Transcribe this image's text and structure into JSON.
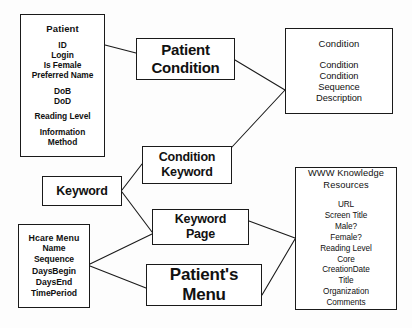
{
  "diagram": {
    "type": "entity-relationship",
    "background_color": "#fdfdfd",
    "line_color": "#1a1a1a",
    "text_color": "#111111",
    "nodes": [
      {
        "id": "patient",
        "kind": "entity",
        "title": "Patient",
        "attributes": [
          "ID",
          "Login",
          "Is Female",
          "Preferred Name",
          "DoB",
          "DoD",
          "Reading Level",
          "Information",
          "Method"
        ]
      },
      {
        "id": "patient_condition",
        "kind": "relationship",
        "label_lines": [
          "Patient",
          "Condition"
        ]
      },
      {
        "id": "condition",
        "kind": "entity",
        "title": "Condition",
        "attributes": [
          "Condition",
          "Condition",
          "Sequence",
          "Description"
        ]
      },
      {
        "id": "condition_keyword",
        "kind": "relationship",
        "label_lines": [
          "Condition",
          "Keyword"
        ]
      },
      {
        "id": "keyword",
        "kind": "relationship",
        "label_lines": [
          "Keyword"
        ]
      },
      {
        "id": "keyword_page",
        "kind": "relationship",
        "label_lines": [
          "Keyword",
          "Page"
        ]
      },
      {
        "id": "patients_menu",
        "kind": "relationship",
        "label_lines": [
          "Patient's",
          "Menu"
        ]
      },
      {
        "id": "hcare_menu",
        "kind": "entity",
        "title": "Hcare Menu",
        "attributes": [
          "Name",
          "Sequence",
          "DaysBegin",
          "DaysEnd",
          "TimePeriod"
        ]
      },
      {
        "id": "www_knowledge_resources",
        "kind": "entity",
        "title_lines": [
          "WWW Knowledge",
          "Resources"
        ],
        "attributes": [
          "URL",
          "Screen Title",
          "Male?",
          "Female?",
          "Reading Level",
          "Core",
          "CreationDate",
          "Title",
          "Organization",
          "Comments"
        ]
      }
    ],
    "edges": [
      {
        "from": "patient",
        "to": "patient_condition"
      },
      {
        "from": "patient_condition",
        "to": "condition"
      },
      {
        "from": "condition_keyword",
        "to": "condition"
      },
      {
        "from": "keyword",
        "to": "condition_keyword"
      },
      {
        "from": "keyword",
        "to": "keyword_page"
      },
      {
        "from": "hcare_menu",
        "to": "keyword_page"
      },
      {
        "from": "hcare_menu",
        "to": "patients_menu"
      },
      {
        "from": "keyword_page",
        "to": "www_knowledge_resources"
      },
      {
        "from": "patients_menu",
        "to": "www_knowledge_resources"
      }
    ]
  },
  "nodes_text": {
    "patient": {
      "title": "Patient",
      "a0": "ID",
      "a1": "Login",
      "a2": "Is Female",
      "a3": "Preferred Name",
      "a4": "DoB",
      "a5": "DoD",
      "a6": "Reading Level",
      "a7": "Information",
      "a8": "Method"
    },
    "patient_condition": {
      "l0": "Patient",
      "l1": "Condition"
    },
    "condition": {
      "title": "Condition",
      "a0": "Condition",
      "a1": "Condition",
      "a2": "Sequence",
      "a3": "Description"
    },
    "condition_keyword": {
      "l0": "Condition",
      "l1": "Keyword"
    },
    "keyword": {
      "l0": "Keyword"
    },
    "keyword_page": {
      "l0": "Keyword",
      "l1": "Page"
    },
    "patients_menu": {
      "l0": "Patient's",
      "l1": "Menu"
    },
    "hcare_menu": {
      "title": "Hcare Menu",
      "a0": "Name",
      "a1": "Sequence",
      "a2": "DaysBegin",
      "a3": "DaysEnd",
      "a4": "TimePeriod"
    },
    "www_knowledge_resources": {
      "t0": "WWW Knowledge",
      "t1": "Resources",
      "a0": "URL",
      "a1": "Screen Title",
      "a2": "Male?",
      "a3": "Female?",
      "a4": "Reading Level",
      "a5": "Core",
      "a6": "CreationDate",
      "a7": "Title",
      "a8": "Organization",
      "a9": "Comments"
    }
  }
}
